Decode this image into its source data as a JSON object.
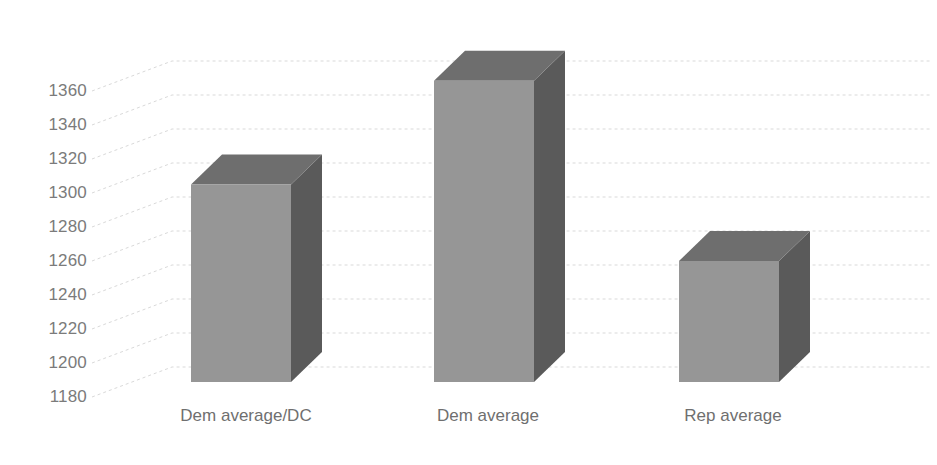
{
  "chart_data": {
    "type": "bar",
    "title": "",
    "subtitle": "",
    "xlabel": "",
    "ylabel": "",
    "categories": [
      "Dem average/DC",
      "Dem average",
      "Rep average"
    ],
    "values": [
      1305,
      1366,
      1260
    ],
    "series": [
      {
        "name": "Average",
        "values": [
          1305,
          1366,
          1260
        ]
      }
    ],
    "ylim": [
      1180,
      1370
    ],
    "yticks": [
      1180,
      1200,
      1220,
      1240,
      1260,
      1280,
      1300,
      1320,
      1340,
      1360
    ],
    "ytick_labels": [
      "1180",
      "1200",
      "1220",
      "1240",
      "1260",
      "1280",
      "1300",
      "1320",
      "1340",
      "1360"
    ],
    "grid": true,
    "grid_axis": "y",
    "legend": false,
    "legend_position": "none",
    "style": "3d-column",
    "annotations": [],
    "colors": {
      "bar_front": "#969696",
      "bar_top": "#6e6e6e",
      "bar_side": "#5a5a5a",
      "gridline": "#d9d9d9",
      "wall": "#ffffff",
      "tick_text": "#7b7b7b",
      "category_text": "#6f6f6f",
      "background": "#ffffff"
    }
  },
  "axis": {
    "y_tick_positions_px": [
      397,
      363,
      329,
      295,
      261,
      227,
      193,
      159,
      125,
      91
    ],
    "category_label_positions_px": [
      246,
      488,
      733
    ]
  }
}
